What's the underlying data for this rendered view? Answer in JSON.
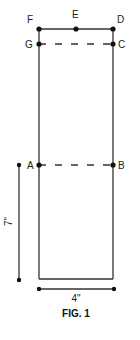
{
  "figure": {
    "caption": "FIG. 1",
    "points": {
      "F": "F",
      "E": "E",
      "D": "D",
      "G": "G",
      "C": "C",
      "A": "A",
      "B": "B"
    },
    "dimensions": {
      "height": "7\"",
      "width": "4\""
    },
    "colors": {
      "line": "#333333",
      "dot": "#111111"
    }
  }
}
